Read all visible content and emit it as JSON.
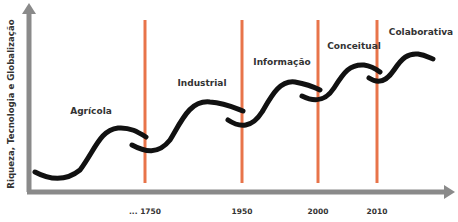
{
  "diagram": {
    "y_axis_label": "Riqueza, Tecnologia e Globalização",
    "eras": [
      {
        "name": "Agrícola",
        "label_x": 91,
        "label_y": 110
      },
      {
        "name": "Industrial",
        "label_x": 202,
        "label_y": 82
      },
      {
        "name": "Informação",
        "label_x": 284,
        "label_y": 64
      },
      {
        "name": "Conceitual",
        "label_x": 354,
        "label_y": 47
      },
      {
        "name": "Colaborativa",
        "label_x": 422,
        "label_y": 33
      }
    ],
    "milestones": [
      {
        "label": "... 1750",
        "x": 145
      },
      {
        "label": "1950",
        "x": 242
      },
      {
        "label": "2000",
        "x": 318
      },
      {
        "label": "2010",
        "x": 377
      }
    ],
    "colors": {
      "axis": "#8a8a8a",
      "milestone_line": "#e8744a",
      "curve": "#111111",
      "text": "#333333"
    }
  }
}
